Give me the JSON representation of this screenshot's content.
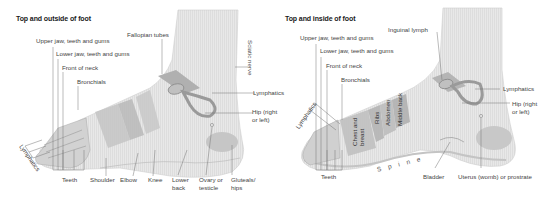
{
  "colors": {
    "skin": "#e6e6e6",
    "stripe": "#d6d6d6",
    "zone_dark": "#b3b3b3",
    "zone_mid": "#c4c4c4",
    "leader": "#777777",
    "text": "#444444",
    "title": "#1a1a1a"
  },
  "left_panel": {
    "title": "Top and outside of foot",
    "labels": {
      "upper_jaw": "Upper jaw, teeth and gums",
      "lower_jaw": "Lower jaw, teeth and gums",
      "front_neck": "Front of neck",
      "bronchials": "Bronchials",
      "fallopian": "Fallopian tubes",
      "sciatic": "Sciatic nerve",
      "lymphatics_right": "Lymphatics",
      "hip_line1": "Hip (right",
      "hip_line2": "or left)",
      "lymphatics_toes": "Lymphatics",
      "teeth": "Teeth",
      "shoulder": "Shoulder",
      "elbow": "Elbow",
      "knee": "Knee",
      "lower_back_line1": "Lower",
      "lower_back_line2": "back",
      "ovary_line1": "Ovary or",
      "ovary_line2": "testicle",
      "gluteals_line1": "Gluteals/",
      "gluteals_line2": "hips"
    }
  },
  "right_panel": {
    "title": "Top and inside of foot",
    "labels": {
      "inguinal": "Inguinal lymph",
      "upper_jaw": "Upper jaw, teeth and gums",
      "lower_jaw": "Lower jaw, teeth and gums",
      "front_neck": "Front of neck",
      "bronchials": "Bronchials",
      "lymphatics_right": "Lymphatics",
      "hip_line1": "Hip (right",
      "hip_line2": "or left)",
      "lymphatics_toes": "Lymphatics",
      "chest_line1": "Chest and",
      "chest_line2": "breast",
      "ribs": "Ribs",
      "abdomen": "Abdomen",
      "middle_back": "Middle back",
      "spine": "Spine",
      "teeth": "Teeth",
      "bladder": "Bladder",
      "uterus": "Uterus (womb) or prostrate"
    }
  }
}
